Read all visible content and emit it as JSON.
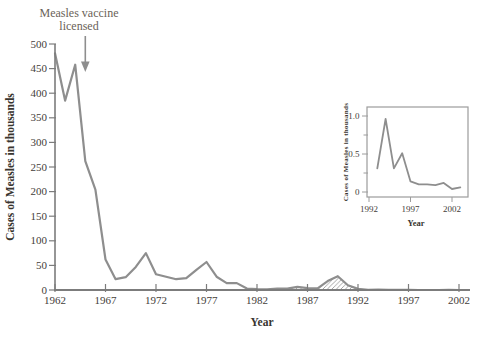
{
  "figure": {
    "background": "#ffffff"
  },
  "chart_data": [
    {
      "id": "main",
      "type": "line",
      "title": "",
      "xlabel": "Year",
      "ylabel": "Cases of Measles in thousands",
      "x_ticks": [
        1962,
        1967,
        1972,
        1977,
        1982,
        1987,
        1992,
        1997,
        2002
      ],
      "y_ticks": [
        0,
        50,
        100,
        150,
        200,
        250,
        300,
        350,
        400,
        450,
        500
      ],
      "xlim": [
        1962,
        2003
      ],
      "ylim": [
        0,
        500
      ],
      "grid": false,
      "line_color": "#8e8e8e",
      "axis_color": "#7c7c7c",
      "tick_text_color": "#44403a",
      "annotation": {
        "line1": "Measles vaccine",
        "line2": "licensed",
        "arrow_year": 1965,
        "color": "#6a6257"
      },
      "highlight": {
        "style": "hatched-area",
        "from_year": 1984,
        "to_year": 1993
      },
      "series": [
        {
          "name": "Cases of measles (thousands)",
          "x": [
            1962,
            1963,
            1964,
            1965,
            1966,
            1967,
            1968,
            1969,
            1970,
            1971,
            1972,
            1973,
            1974,
            1975,
            1976,
            1977,
            1978,
            1979,
            1980,
            1981,
            1982,
            1983,
            1984,
            1985,
            1986,
            1987,
            1988,
            1989,
            1990,
            1991,
            1992,
            1993,
            1994,
            1995,
            1996,
            1997,
            1998,
            1999,
            2000,
            2001,
            2002
          ],
          "y": [
            481,
            385,
            458,
            262,
            204,
            62,
            22,
            26,
            47,
            75,
            32,
            27,
            22,
            24,
            41,
            57,
            27,
            14,
            14,
            3,
            1.7,
            1.5,
            2.6,
            2.8,
            6.3,
            3.7,
            3.4,
            18,
            28,
            9.6,
            2.2,
            0.3,
            1,
            0.3,
            0.5,
            0.14,
            0.1,
            0.1,
            0.09,
            0.12,
            0.04
          ]
        }
      ]
    },
    {
      "id": "inset",
      "type": "line",
      "title": "",
      "xlabel": "Year",
      "ylabel": "Cases of Measles in thousands",
      "x_ticks": [
        1992,
        1997,
        2002
      ],
      "y_ticks": [
        0,
        0.5,
        1
      ],
      "y_tick_labels": [
        "0",
        "0.5",
        "1.0"
      ],
      "y_minor_ticks": [
        0.25,
        0.75
      ],
      "xlim": [
        1992,
        2004
      ],
      "ylim": [
        0,
        1.1
      ],
      "grid": false,
      "line_color": "#8e8e8e",
      "box_color": "#9c9c9c",
      "series": [
        {
          "name": "Cases of measles (thousands)",
          "x": [
            1993,
            1994,
            1995,
            1996,
            1997,
            1998,
            1999,
            2000,
            2001,
            2002,
            2003
          ],
          "y": [
            0.31,
            0.96,
            0.31,
            0.51,
            0.14,
            0.1,
            0.1,
            0.09,
            0.12,
            0.04,
            0.06
          ]
        }
      ]
    }
  ]
}
